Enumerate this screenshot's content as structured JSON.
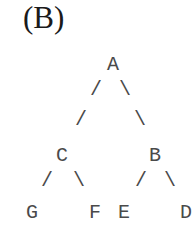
{
  "figure_label": "(B)",
  "tree": {
    "nodes": [
      {
        "id": "A",
        "label": "A",
        "x": 106,
        "y": 55
      },
      {
        "id": "C",
        "label": "C",
        "x": 55,
        "y": 146
      },
      {
        "id": "B",
        "label": "B",
        "x": 148,
        "y": 146
      },
      {
        "id": "G",
        "label": "G",
        "x": 25,
        "y": 203
      },
      {
        "id": "F",
        "label": "F",
        "x": 88,
        "y": 203
      },
      {
        "id": "E",
        "label": "E",
        "x": 117,
        "y": 203
      },
      {
        "id": "D",
        "label": "D",
        "x": 179,
        "y": 203
      }
    ],
    "edges": [
      {
        "from": "A",
        "to": "C",
        "glyph": "/"
      },
      {
        "from": "A",
        "to": "B",
        "glyph": "\\"
      },
      {
        "from": "C",
        "to": "G",
        "glyph": "/"
      },
      {
        "from": "C",
        "to": "F",
        "glyph": "\\"
      },
      {
        "from": "B",
        "to": "E",
        "glyph": "/"
      },
      {
        "from": "B",
        "to": "D",
        "glyph": "\\"
      }
    ],
    "edge_glyphs": {
      "a_c_1": "/",
      "a_c_2": "/",
      "a_b_1": "\\",
      "a_b_2": "\\",
      "c_g": "/",
      "c_f": "\\",
      "b_e": "/",
      "b_d": "\\"
    },
    "text_color": "#4a4a4a"
  }
}
